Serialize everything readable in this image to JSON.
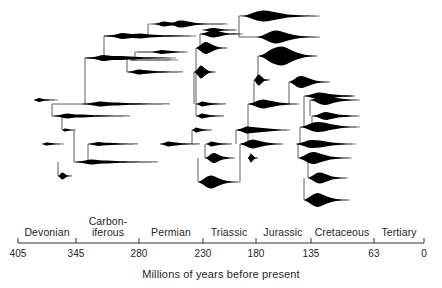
{
  "figure": {
    "type": "phylogenetic-spindle-diagram",
    "background_color": "#ffffff",
    "ink_color": "#000000",
    "line_color": "#4d4d4d"
  },
  "axis": {
    "title": "Millions of years before present",
    "direction": "decreasing-left-to-right",
    "line_y": 243,
    "x_start": 18,
    "x_end": 424,
    "ticks": [
      {
        "label": "405",
        "value": 405,
        "x": 18
      },
      {
        "label": "345",
        "value": 345,
        "x": 76
      },
      {
        "label": "280",
        "value": 280,
        "x": 139
      },
      {
        "label": "230",
        "value": 230,
        "x": 203
      },
      {
        "label": "180",
        "value": 180,
        "x": 256
      },
      {
        "label": "135",
        "value": 135,
        "x": 311
      },
      {
        "label": "63",
        "value": 63,
        "x": 374
      },
      {
        "label": "0",
        "value": 0,
        "x": 424
      }
    ],
    "periods": [
      {
        "label": "Devonian",
        "x_center": 47,
        "x_start": 18,
        "x_end": 76,
        "two_line": false
      },
      {
        "label": "Carbon-\niferous",
        "x_center": 108,
        "x_start": 76,
        "x_end": 139,
        "two_line": true
      },
      {
        "label": "Permian",
        "x_center": 171,
        "x_start": 139,
        "x_end": 203,
        "two_line": false
      },
      {
        "label": "Triassic",
        "x_center": 229,
        "x_start": 203,
        "x_end": 256,
        "two_line": false
      },
      {
        "label": "Jurassic",
        "x_center": 283,
        "x_start": 256,
        "x_end": 311,
        "two_line": false
      },
      {
        "label": "Cretaceous",
        "x_center": 342,
        "x_start": 311,
        "x_end": 374,
        "two_line": false
      },
      {
        "label": "Tertiary",
        "x_center": 399,
        "x_start": 374,
        "x_end": 424,
        "two_line": false
      }
    ]
  },
  "chart_data": {
    "type": "area",
    "title": "",
    "xlabel": "Millions of years before present",
    "ylabel": "",
    "xlim": [
      405,
      0
    ],
    "grid": false,
    "legend": null,
    "spindles": [
      {
        "id": "s01",
        "y": 24,
        "x_start": 148,
        "x_end": 228,
        "widths": [
          0,
          1,
          5,
          3,
          7,
          5,
          2,
          1,
          0.5,
          0.4,
          0
        ]
      },
      {
        "id": "s02",
        "y": 16,
        "x_start": 239,
        "x_end": 320,
        "widths": [
          0,
          2,
          8,
          11,
          9,
          6,
          3,
          2,
          1,
          0.6,
          0
        ]
      },
      {
        "id": "s03",
        "y": 36,
        "x_start": 104,
        "x_end": 196,
        "widths": [
          0,
          2,
          6,
          4,
          5,
          3,
          2,
          1.5,
          1,
          0.5,
          0
        ]
      },
      {
        "id": "s04",
        "y": 30,
        "x_start": 202,
        "x_end": 237,
        "widths": [
          0,
          1,
          3,
          4,
          3.5,
          2.5,
          1.5,
          1,
          0.6,
          0.4,
          0
        ]
      },
      {
        "id": "s05",
        "y": 34,
        "x_start": 200,
        "x_end": 243,
        "widths": [
          0,
          2,
          5,
          7,
          6,
          4,
          2,
          1.2,
          0.8,
          0.5,
          0
        ]
      },
      {
        "id": "s06",
        "y": 37,
        "x_start": 256,
        "x_end": 320,
        "widths": [
          0,
          3,
          9,
          13,
          11,
          7,
          4,
          2,
          1,
          0.6,
          0
        ]
      },
      {
        "id": "s07",
        "y": 52,
        "x_start": 135,
        "x_end": 188,
        "widths": [
          0,
          0.6,
          0.6,
          0.6,
          2,
          4,
          3,
          2,
          1,
          0.5,
          0
        ]
      },
      {
        "id": "s08",
        "y": 60,
        "x_start": 130,
        "x_end": 178,
        "widths": [
          0,
          0.4,
          0.4,
          0.4,
          0.4,
          0.4,
          0.4,
          0.4,
          0.3,
          0.2,
          0
        ]
      },
      {
        "id": "s09",
        "y": 48,
        "x_start": 196,
        "x_end": 228,
        "widths": [
          0,
          4,
          9,
          12,
          10,
          7,
          4,
          2,
          1,
          0.5,
          0
        ]
      },
      {
        "id": "s10",
        "y": 56,
        "x_start": 258,
        "x_end": 318,
        "widths": [
          0,
          4,
          12,
          17,
          19,
          15,
          9,
          5,
          2,
          1,
          0
        ]
      },
      {
        "id": "s11",
        "y": 58,
        "x_start": 85,
        "x_end": 176,
        "widths": [
          0,
          2,
          6,
          4,
          4,
          3,
          2,
          1.5,
          1,
          0.5,
          0
        ]
      },
      {
        "id": "s12",
        "y": 72,
        "x_start": 127,
        "x_end": 183,
        "widths": [
          0,
          2,
          5,
          4,
          3,
          2,
          1.5,
          1,
          0.6,
          0.3,
          0
        ]
      },
      {
        "id": "s13",
        "y": 72,
        "x_start": 194,
        "x_end": 216,
        "widths": [
          0,
          3,
          8,
          13,
          11,
          7,
          4,
          2,
          1,
          0.5,
          0
        ]
      },
      {
        "id": "s14",
        "y": 80,
        "x_start": 254,
        "x_end": 270,
        "widths": [
          0,
          4,
          9,
          11,
          9,
          6,
          3,
          1.5,
          0.8,
          0.4,
          0
        ]
      },
      {
        "id": "s15",
        "y": 82,
        "x_start": 289,
        "x_end": 330,
        "widths": [
          0,
          4,
          10,
          12,
          10,
          7,
          4,
          2,
          1,
          0.6,
          0
        ]
      },
      {
        "id": "s16",
        "y": 96,
        "x_start": 304,
        "x_end": 355,
        "widths": [
          0,
          2,
          5,
          7,
          6,
          4,
          3,
          2,
          1.5,
          1,
          0
        ]
      },
      {
        "id": "s17",
        "y": 104,
        "x_start": 82,
        "x_end": 170,
        "widths": [
          0,
          2,
          5,
          3.5,
          3,
          2,
          1.5,
          1,
          0.6,
          0.3,
          0
        ]
      },
      {
        "id": "s18",
        "y": 100,
        "x_start": 34,
        "x_end": 58,
        "widths": [
          0,
          2,
          4,
          3,
          2,
          1.5,
          1,
          0.6,
          0.4,
          0.2,
          0
        ]
      },
      {
        "id": "s19",
        "y": 104,
        "x_start": 196,
        "x_end": 226,
        "widths": [
          0,
          2,
          5,
          4,
          3,
          2,
          1.5,
          1,
          0.6,
          0.3,
          0
        ]
      },
      {
        "id": "s20",
        "y": 104,
        "x_start": 248,
        "x_end": 300,
        "widths": [
          0,
          3,
          7,
          9,
          7,
          5,
          3,
          2,
          1,
          0.5,
          0
        ]
      },
      {
        "id": "s21",
        "y": 100,
        "x_start": 310,
        "x_end": 360,
        "widths": [
          0,
          3,
          8,
          10,
          8,
          5,
          3,
          2,
          1,
          0.5,
          0
        ]
      },
      {
        "id": "s22",
        "y": 116,
        "x_start": 52,
        "x_end": 130,
        "widths": [
          0,
          2,
          5,
          3,
          3,
          2,
          1.5,
          1,
          0.6,
          0.3,
          0
        ]
      },
      {
        "id": "s23",
        "y": 116,
        "x_start": 196,
        "x_end": 224,
        "widths": [
          0,
          2,
          5,
          4,
          3,
          2,
          1.5,
          1,
          0.6,
          0.3,
          0
        ]
      },
      {
        "id": "s24",
        "y": 116,
        "x_start": 312,
        "x_end": 360,
        "widths": [
          0,
          2,
          6,
          8,
          6,
          4,
          2.5,
          2,
          1,
          0.5,
          0
        ]
      },
      {
        "id": "s25",
        "y": 130,
        "x_start": 62,
        "x_end": 76,
        "widths": [
          0,
          1.5,
          3,
          2.5,
          2,
          1.5,
          1,
          0.6,
          0.4,
          0.2,
          0
        ]
      },
      {
        "id": "s26",
        "y": 130,
        "x_start": 192,
        "x_end": 212,
        "widths": [
          0,
          2,
          5,
          4,
          3,
          2,
          1.5,
          1,
          0.6,
          0.3,
          0
        ]
      },
      {
        "id": "s27",
        "y": 130,
        "x_start": 236,
        "x_end": 290,
        "widths": [
          0,
          3,
          7,
          6,
          5,
          4,
          3,
          2,
          1,
          0.5,
          0
        ]
      },
      {
        "id": "s28",
        "y": 127,
        "x_start": 300,
        "x_end": 360,
        "widths": [
          0,
          3,
          8,
          10,
          9,
          6,
          4,
          2,
          1,
          0.5,
          0
        ]
      },
      {
        "id": "s29",
        "y": 144,
        "x_start": 42,
        "x_end": 64,
        "widths": [
          0,
          1.5,
          3,
          2.5,
          2,
          1.5,
          1,
          0.6,
          0.4,
          0.2,
          0
        ]
      },
      {
        "id": "s30",
        "y": 144,
        "x_start": 88,
        "x_end": 138,
        "widths": [
          0,
          2,
          4,
          3,
          2.5,
          2,
          1.5,
          1,
          0.6,
          0.3,
          0
        ]
      },
      {
        "id": "s31",
        "y": 144,
        "x_start": 160,
        "x_end": 200,
        "widths": [
          0,
          2,
          5,
          4,
          3,
          2,
          1.5,
          1,
          0.6,
          0.3,
          0
        ]
      },
      {
        "id": "s32",
        "y": 144,
        "x_start": 206,
        "x_end": 232,
        "widths": [
          0,
          2,
          5,
          4,
          3,
          2,
          1.5,
          1,
          0.6,
          0.3,
          0
        ]
      },
      {
        "id": "s33",
        "y": 144,
        "x_start": 240,
        "x_end": 284,
        "widths": [
          0,
          3,
          7,
          9,
          7,
          5,
          3,
          2,
          1,
          0.5,
          0
        ]
      },
      {
        "id": "s34",
        "y": 144,
        "x_start": 296,
        "x_end": 356,
        "widths": [
          0,
          3,
          7,
          8,
          7,
          5,
          3,
          2,
          1,
          0.5,
          0
        ]
      },
      {
        "id": "s35",
        "y": 158,
        "x_start": 205,
        "x_end": 235,
        "widths": [
          0,
          3,
          8,
          10,
          8,
          5,
          3,
          2,
          1,
          0.5,
          0
        ]
      },
      {
        "id": "s36",
        "y": 158,
        "x_start": 248,
        "x_end": 258,
        "widths": [
          0,
          3,
          7,
          9,
          7,
          5,
          3,
          1.5,
          0.8,
          0.4,
          0
        ]
      },
      {
        "id": "s37",
        "y": 158,
        "x_start": 298,
        "x_end": 352,
        "widths": [
          0,
          4,
          10,
          12,
          9,
          6,
          3,
          2,
          1,
          0.5,
          0
        ]
      },
      {
        "id": "s38",
        "y": 162,
        "x_start": 74,
        "x_end": 158,
        "widths": [
          0,
          2,
          5,
          3.5,
          3,
          2,
          1.5,
          1,
          0.6,
          0.3,
          0
        ]
      },
      {
        "id": "s39",
        "y": 176,
        "x_start": 58,
        "x_end": 72,
        "widths": [
          0,
          2,
          5,
          7,
          6,
          4,
          2,
          1,
          0.6,
          0.3,
          0
        ]
      },
      {
        "id": "s40",
        "y": 182,
        "x_start": 198,
        "x_end": 240,
        "widths": [
          0,
          4,
          10,
          13,
          11,
          7,
          4,
          2,
          1,
          0.5,
          0
        ]
      },
      {
        "id": "s41",
        "y": 178,
        "x_start": 308,
        "x_end": 348,
        "widths": [
          0,
          4,
          9,
          11,
          9,
          6,
          3,
          2,
          1,
          0.5,
          0
        ]
      },
      {
        "id": "s42",
        "y": 200,
        "x_start": 304,
        "x_end": 350,
        "widths": [
          0,
          5,
          11,
          14,
          11,
          7,
          4,
          2,
          1,
          0.5,
          0
        ]
      }
    ],
    "connectors": [
      {
        "from": [
          148,
          24
        ],
        "to": [
          148,
          36
        ]
      },
      {
        "from": [
          148,
          36
        ],
        "to": [
          104,
          36
        ]
      },
      {
        "from": [
          104,
          36
        ],
        "to": [
          104,
          58
        ]
      },
      {
        "from": [
          104,
          58
        ],
        "to": [
          85,
          58
        ]
      },
      {
        "from": [
          200,
          34
        ],
        "to": [
          200,
          48
        ]
      },
      {
        "from": [
          239,
          16
        ],
        "to": [
          239,
          37
        ]
      },
      {
        "from": [
          256,
          37
        ],
        "to": [
          239,
          37
        ]
      },
      {
        "from": [
          135,
          52
        ],
        "to": [
          135,
          60
        ]
      },
      {
        "from": [
          135,
          60
        ],
        "to": [
          130,
          60
        ]
      },
      {
        "from": [
          127,
          72
        ],
        "to": [
          127,
          58
        ]
      },
      {
        "from": [
          85,
          58
        ],
        "to": [
          85,
          104
        ]
      },
      {
        "from": [
          85,
          104
        ],
        "to": [
          82,
          104
        ]
      },
      {
        "from": [
          82,
          104
        ],
        "to": [
          52,
          104
        ]
      },
      {
        "from": [
          52,
          104
        ],
        "to": [
          52,
          116
        ]
      },
      {
        "from": [
          62,
          116
        ],
        "to": [
          62,
          130
        ]
      },
      {
        "from": [
          74,
          130
        ],
        "to": [
          74,
          162
        ]
      },
      {
        "from": [
          58,
          162
        ],
        "to": [
          58,
          176
        ]
      },
      {
        "from": [
          88,
          144
        ],
        "to": [
          88,
          162
        ]
      },
      {
        "from": [
          196,
          48
        ],
        "to": [
          196,
          104
        ]
      },
      {
        "from": [
          196,
          104
        ],
        "to": [
          196,
          116
        ]
      },
      {
        "from": [
          194,
          72
        ],
        "to": [
          194,
          104
        ]
      },
      {
        "from": [
          192,
          130
        ],
        "to": [
          192,
          144
        ]
      },
      {
        "from": [
          205,
          144
        ],
        "to": [
          205,
          158
        ]
      },
      {
        "from": [
          198,
          158
        ],
        "to": [
          198,
          182
        ]
      },
      {
        "from": [
          248,
          104
        ],
        "to": [
          248,
          144
        ]
      },
      {
        "from": [
          236,
          130
        ],
        "to": [
          236,
          144
        ]
      },
      {
        "from": [
          254,
          80
        ],
        "to": [
          254,
          104
        ]
      },
      {
        "from": [
          240,
          144
        ],
        "to": [
          240,
          182
        ]
      },
      {
        "from": [
          258,
          56
        ],
        "to": [
          258,
          80
        ]
      },
      {
        "from": [
          289,
          82
        ],
        "to": [
          289,
          104
        ]
      },
      {
        "from": [
          300,
          127
        ],
        "to": [
          300,
          144
        ]
      },
      {
        "from": [
          304,
          96
        ],
        "to": [
          304,
          127
        ]
      },
      {
        "from": [
          308,
          158
        ],
        "to": [
          308,
          178
        ]
      },
      {
        "from": [
          304,
          178
        ],
        "to": [
          304,
          200
        ]
      },
      {
        "from": [
          310,
          100
        ],
        "to": [
          310,
          116
        ]
      },
      {
        "from": [
          312,
          116
        ],
        "to": [
          312,
          127
        ]
      },
      {
        "from": [
          298,
          144
        ],
        "to": [
          298,
          158
        ]
      }
    ]
  }
}
